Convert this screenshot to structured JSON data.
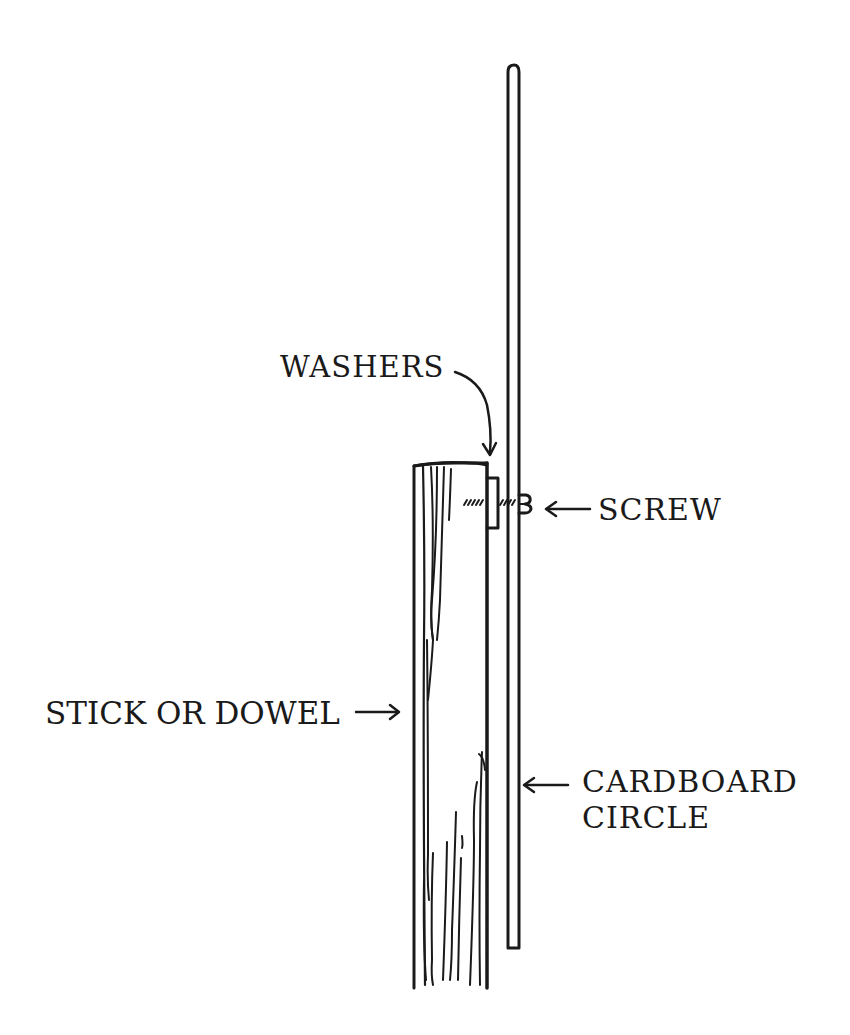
{
  "diagram": {
    "type": "hand-drawn assembly illustration",
    "labels": {
      "washers": "WASHERS",
      "screw": "SCREW",
      "stick_or_dowel": "STICK OR DOWEL",
      "cardboard_line1": "CARDBOARD",
      "cardboard_line2": "CIRCLE"
    },
    "parts": [
      {
        "id": "stick-or-dowel",
        "label": "STICK OR DOWEL"
      },
      {
        "id": "washers",
        "label": "WASHERS"
      },
      {
        "id": "screw",
        "label": "SCREW"
      },
      {
        "id": "cardboard-circle",
        "label": "CARDBOARD CIRCLE"
      }
    ],
    "colors": {
      "ink": "#1a1a1a",
      "background": "#ffffff"
    }
  }
}
